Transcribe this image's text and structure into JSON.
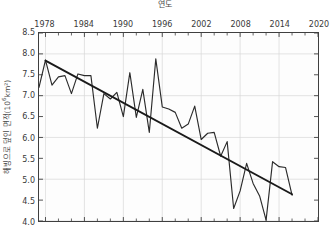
{
  "chart_data": {
    "type": "line",
    "title": "연도",
    "xlabel": "연도",
    "ylabel": "해빙으로 덮인 면적(10⁶km²)",
    "ylabel_base": "해빙으로 덮인 면적(10",
    "ylabel_exp": "6",
    "ylabel_tail": "km²)",
    "grid": true,
    "legend": "none",
    "xlim": [
      1977,
      2020
    ],
    "ylim": [
      4.0,
      8.5
    ],
    "xticks": [
      1978,
      1984,
      1990,
      1996,
      2002,
      2008,
      2014,
      2020
    ],
    "xtick_labels": [
      "1978",
      "1984",
      "1990",
      "1996",
      "2002",
      "2008",
      "2014",
      "2020"
    ],
    "xminor_step": 2,
    "yticks": [
      4.0,
      4.5,
      5.0,
      5.5,
      6.0,
      6.5,
      7.0,
      7.5,
      8.0,
      8.5
    ],
    "ytick_labels": [
      "4.0",
      "4.5",
      "5.0",
      "5.5",
      "6.0",
      "6.5",
      "7.0",
      "7.5",
      "8.0",
      "8.5"
    ],
    "x_axis_position": "top",
    "series": [
      {
        "name": "해빙 면적",
        "type": "line",
        "color": "#2b2b2b",
        "x": [
          1977,
          1978,
          1979,
          1980,
          1981,
          1982,
          1983,
          1984,
          1985,
          1986,
          1987,
          1988,
          1989,
          1990,
          1991,
          1992,
          1993,
          1994,
          1995,
          1996,
          1997,
          1998,
          1999,
          2000,
          2001,
          2002,
          2003,
          2004,
          2005,
          2006,
          2007,
          2008,
          2009,
          2010,
          2011,
          2012,
          2013,
          2014,
          2015,
          2016
        ],
        "values": [
          7.2,
          7.85,
          7.25,
          7.45,
          7.48,
          7.05,
          7.52,
          7.48,
          7.48,
          6.22,
          7.05,
          6.92,
          7.08,
          6.5,
          7.55,
          6.48,
          7.15,
          6.12,
          7.88,
          6.73,
          6.68,
          6.6,
          6.22,
          6.32,
          6.75,
          5.95,
          6.1,
          6.12,
          5.55,
          5.9,
          4.3,
          4.72,
          5.38,
          4.9,
          4.6,
          4.02,
          5.42,
          5.3,
          5.28,
          4.62
        ]
      },
      {
        "name": "추세선",
        "type": "trend",
        "color": "#1a1a1a",
        "x": [
          1978,
          2016
        ],
        "values": [
          7.84,
          4.64
        ]
      }
    ]
  }
}
